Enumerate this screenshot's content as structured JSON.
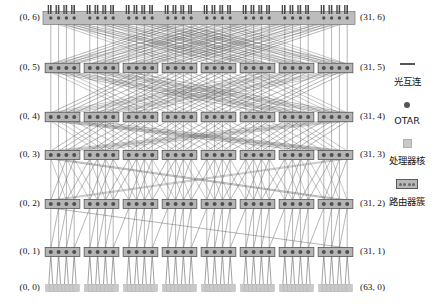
{
  "figure": {
    "type": "hierarchical-optical-network-topology-diagram",
    "levels": 7,
    "width": 448,
    "height": 304
  },
  "axis": {
    "left_labels": [
      {
        "text": "(0, 6)",
        "level": 6
      },
      {
        "text": "(0, 5)",
        "level": 5
      },
      {
        "text": "(0, 4)",
        "level": 4
      },
      {
        "text": "(0, 3)",
        "level": 3
      },
      {
        "text": "(0, 2)",
        "level": 2
      },
      {
        "text": "(0, 1)",
        "level": 1
      },
      {
        "text": "(0, 0)",
        "level": 0
      }
    ],
    "right_labels": [
      {
        "text": "(31, 6)",
        "level": 6
      },
      {
        "text": "(31, 5)",
        "level": 5
      },
      {
        "text": "(31, 4)",
        "level": 4
      },
      {
        "text": "(31, 3)",
        "level": 3
      },
      {
        "text": "(31, 2)",
        "level": 2
      },
      {
        "text": "(31, 1)",
        "level": 1
      },
      {
        "text": "(63, 0)",
        "level": 0
      }
    ]
  },
  "legend": {
    "items": [
      {
        "symbol": "line-symbol",
        "label": "光互连"
      },
      {
        "symbol": "dot-symbol",
        "label": "OTAR"
      },
      {
        "symbol": "core-symbol",
        "label": "处理器核"
      },
      {
        "symbol": "cluster-symbol",
        "label": "路由器簇"
      }
    ]
  },
  "colors": {
    "cluster_fill": "#b5b5b5",
    "cluster_stroke": "#555555",
    "otar_dot": "#4f4f4f",
    "core_fill": "#c9c9c9",
    "link_stroke": "#6b6b6b",
    "label_text": "#111111",
    "background": "#ffffff"
  },
  "chart_data": {
    "type": "diagram-network",
    "title": "",
    "rows": [
      {
        "level": 6,
        "y": 18,
        "clusters": 8,
        "nodes_per_cluster": 4,
        "x_start": 43,
        "x_end": 355,
        "bar": true,
        "stubs": true
      },
      {
        "level": 5,
        "y": 68,
        "clusters": 8,
        "nodes_per_cluster": 4,
        "x_start": 43,
        "x_end": 355,
        "bar": true,
        "stubs": false
      },
      {
        "level": 4,
        "y": 117,
        "clusters": 8,
        "nodes_per_cluster": 4,
        "x_start": 43,
        "x_end": 355,
        "bar": true,
        "stubs": false
      },
      {
        "level": 3,
        "y": 155,
        "clusters": 8,
        "nodes_per_cluster": 4,
        "x_start": 43,
        "x_end": 355,
        "bar": false,
        "stubs": false
      },
      {
        "level": 2,
        "y": 204,
        "clusters": 8,
        "nodes_per_cluster": 4,
        "x_start": 43,
        "x_end": 355,
        "bar": false,
        "stubs": false
      },
      {
        "level": 1,
        "y": 252,
        "clusters": 8,
        "nodes_per_cluster": 4,
        "x_start": 43,
        "x_end": 355,
        "bar": false,
        "stubs": false
      },
      {
        "level": 0,
        "y": 288,
        "clusters": 8,
        "nodes_per_cluster": 8,
        "x_start": 43,
        "x_end": 355,
        "bar": false,
        "stubs": false,
        "cores": true
      }
    ],
    "link_groups": [
      {
        "from_level": 0,
        "to_level": 1,
        "pattern": "fan-in-4"
      },
      {
        "from_level": 1,
        "to_level": 2,
        "pattern": "local-cluster"
      },
      {
        "from_level": 2,
        "to_level": 3,
        "pattern": "cluster-shuffle-1"
      },
      {
        "from_level": 3,
        "to_level": 4,
        "pattern": "cluster-shuffle-2"
      },
      {
        "from_level": 4,
        "to_level": 5,
        "pattern": "cluster-shuffle-4"
      },
      {
        "from_level": 5,
        "to_level": 6,
        "pattern": "cluster-shuffle-8"
      }
    ]
  }
}
